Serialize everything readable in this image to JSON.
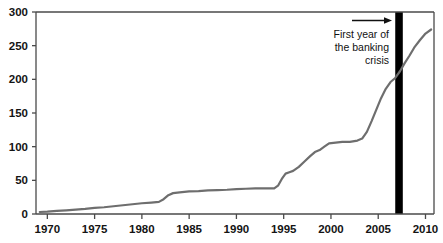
{
  "chart_data": {
    "type": "line",
    "title": "",
    "subtitle": "",
    "xlabel": "",
    "ylabel": "",
    "xlim": [
      1968.8,
      2010.9
    ],
    "ylim": [
      0,
      300
    ],
    "grid": false,
    "legend": null,
    "xticks": [
      1970,
      1975,
      1980,
      1985,
      1990,
      1995,
      2000,
      2005,
      2010
    ],
    "xtick_labels": [
      "1970",
      "1975",
      "1980",
      "1985",
      "1990",
      "1995",
      "2000",
      "2005",
      "2010"
    ],
    "yticks": [
      0,
      50,
      100,
      150,
      200,
      250,
      300
    ],
    "ytick_labels": [
      "0",
      "50",
      "100",
      "150",
      "200",
      "250",
      "300"
    ],
    "series": [
      {
        "name": "value",
        "color": "#6e6e6e",
        "linewidth": 2.2,
        "x": [
          1969.2,
          1970,
          1971,
          1972,
          1973,
          1974,
          1975,
          1976,
          1977,
          1978,
          1979,
          1980,
          1981,
          1981.8,
          1982.3,
          1982.8,
          1983.3,
          1984,
          1985,
          1986,
          1987,
          1988,
          1989,
          1990,
          1991,
          1992,
          1993,
          1994,
          1994.4,
          1994.8,
          1995.2,
          1995.6,
          1996,
          1996.6,
          1997.2,
          1997.8,
          1998.3,
          1998.8,
          1999.3,
          1999.8,
          2000.5,
          2001.2,
          2002,
          2002.8,
          2003.3,
          2003.8,
          2004.3,
          2004.8,
          2005.3,
          2005.8,
          2006.3,
          2006.8,
          2007.3,
          2007.8,
          2008.3,
          2008.8,
          2009.4,
          2010,
          2010.6
        ],
        "y": [
          3,
          3.5,
          4.5,
          5.5,
          6.5,
          7.5,
          9,
          10,
          11.5,
          13,
          14.5,
          16,
          17,
          18,
          22,
          28,
          31,
          32,
          33.5,
          34,
          35,
          35.5,
          36,
          37,
          37.5,
          38,
          38,
          38,
          42,
          52,
          60,
          62,
          64,
          70,
          78,
          86,
          92,
          95,
          100,
          105,
          106,
          107,
          107,
          109,
          112,
          122,
          138,
          155,
          172,
          186,
          196,
          202,
          212,
          224,
          235,
          247,
          258,
          268,
          274
        ]
      }
    ],
    "annotations": [
      {
        "name": "banking-crisis-annotation",
        "lines": [
          "First year of",
          "the banking",
          "crisis"
        ],
        "arrow": {
          "x1": 1970,
          "x2": 1970,
          "direction": "right"
        },
        "marker": {
          "name": "banking-crisis-band",
          "type": "vertical-band",
          "x_start": 2006.8,
          "x_end": 2007.6,
          "color": "#000000"
        }
      }
    ],
    "axis_color": "#4a4a4a",
    "background": "#ffffff"
  },
  "annotation": {
    "line1": "First year of",
    "line2": "the banking",
    "line3": "crisis"
  }
}
